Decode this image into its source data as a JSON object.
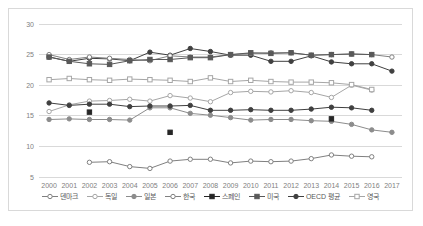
{
  "chart_data": {
    "type": "line",
    "title": "",
    "xlabel": "",
    "ylabel": "",
    "x": [
      2000,
      2001,
      2002,
      2003,
      2004,
      2005,
      2006,
      2007,
      2008,
      2009,
      2010,
      2011,
      2012,
      2013,
      2014,
      2015,
      2016,
      2017
    ],
    "xtick_labels": [
      "2000",
      "2001",
      "2002",
      "2003",
      "2004",
      "2005",
      "2006",
      "2007",
      "2008",
      "2009",
      "2010",
      "2011",
      "2012",
      "2013",
      "2014",
      "2015",
      "2016",
      "2017"
    ],
    "ytick_labels": [
      "5",
      "10",
      "15",
      "20",
      "25",
      "30"
    ],
    "yticks": [
      5,
      10,
      15,
      20,
      25,
      30
    ],
    "ylim": [
      5,
      30
    ],
    "grid": "horizontal",
    "legend_position": "bottom",
    "series": [
      {
        "name": "덴마크",
        "marker": "open-circle",
        "color": "#808080",
        "values": [
          25.0,
          24.2,
          24.6,
          24.4,
          24.2,
          24.0,
          24.8,
          24.6,
          24.6,
          25.0,
          25.2,
          25.3,
          25.3,
          24.9,
          25.0,
          25.1,
          25.0,
          24.6
        ]
      },
      {
        "name": "독일",
        "marker": "open-circle",
        "color": "#a6a6a6",
        "values": [
          15.7,
          16.8,
          17.4,
          17.5,
          17.7,
          17.4,
          18.3,
          17.9,
          17.3,
          18.8,
          19.0,
          18.9,
          19.1,
          18.8,
          18.0,
          20.0,
          19.2,
          null
        ]
      },
      {
        "name": "일본",
        "marker": "filled-circle",
        "color": "#8c8c8c",
        "values": [
          14.4,
          14.5,
          14.4,
          14.4,
          14.3,
          16.3,
          16.3,
          15.4,
          15.1,
          14.7,
          14.3,
          14.4,
          14.4,
          14.2,
          14.1,
          13.6,
          12.7,
          12.3
        ]
      },
      {
        "name": "한국",
        "marker": "open-circle",
        "color": "#808080",
        "values": [
          null,
          null,
          7.4,
          7.5,
          6.7,
          6.4,
          7.6,
          7.9,
          7.9,
          7.3,
          7.6,
          7.5,
          7.6,
          8.0,
          8.6,
          8.4,
          8.3,
          null
        ]
      },
      {
        "name": "스페인",
        "marker": "filled-square",
        "color": "#262626",
        "values": [
          null,
          null,
          15.6,
          null,
          null,
          null,
          12.3,
          null,
          null,
          null,
          null,
          null,
          null,
          null,
          14.5,
          null,
          null,
          null
        ]
      },
      {
        "name": "미국",
        "marker": "filled-square",
        "color": "#595959",
        "values": [
          24.6,
          23.9,
          23.5,
          23.4,
          24.0,
          24.2,
          24.2,
          24.5,
          24.5,
          25.0,
          25.3,
          25.2,
          25.3,
          24.9,
          25.0,
          25.1,
          25.0,
          null
        ]
      },
      {
        "name": "OECD 평균",
        "marker": "filled-circle",
        "color": "#404040",
        "values": [
          17.1,
          16.7,
          16.9,
          16.9,
          16.5,
          16.6,
          16.6,
          16.7,
          15.9,
          15.9,
          16.0,
          15.9,
          15.9,
          16.1,
          16.4,
          16.3,
          15.9,
          null
        ]
      },
      {
        "name": "영국",
        "marker": "open-square",
        "color": "#a6a6a6",
        "values": [
          20.9,
          21.1,
          20.9,
          20.8,
          21.0,
          20.9,
          20.8,
          20.6,
          21.2,
          20.6,
          20.8,
          20.6,
          20.5,
          20.5,
          20.4,
          20.1,
          19.3,
          null
        ]
      }
    ],
    "extra_series": [
      {
        "name": "상위선",
        "marker": "filled-circle",
        "color": "#404040",
        "values": [
          24.6,
          23.9,
          24.4,
          24.3,
          24.0,
          25.4,
          24.9,
          26.0,
          25.5,
          24.9,
          24.9,
          23.9,
          23.9,
          24.8,
          23.8,
          23.5,
          23.5,
          22.3
        ]
      }
    ]
  },
  "legend": {
    "items": [
      {
        "label": "덴마크"
      },
      {
        "label": "독일"
      },
      {
        "label": "일본"
      },
      {
        "label": "한국"
      },
      {
        "label": "스페인"
      },
      {
        "label": "미국"
      },
      {
        "label": "OECD 평균"
      },
      {
        "label": "영국"
      }
    ]
  }
}
